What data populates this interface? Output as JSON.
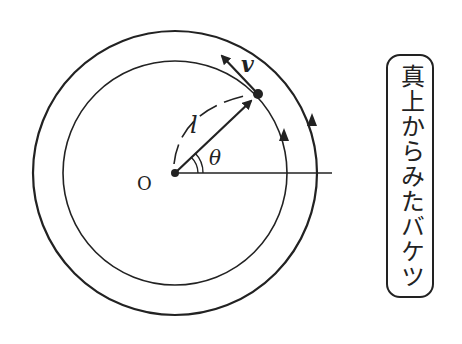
{
  "diagram": {
    "title": "真上からみたバケツ",
    "labels": {
      "origin": "O",
      "length": "l",
      "angle": "θ",
      "velocity": "v"
    },
    "geometry": {
      "center": [
        175,
        173
      ],
      "outer_radius": 142,
      "inner_radius": 112,
      "point": [
        258,
        94
      ],
      "reference_line_end_x": 332
    },
    "colors": {
      "stroke": "#222222",
      "background": "#ffffff"
    }
  }
}
